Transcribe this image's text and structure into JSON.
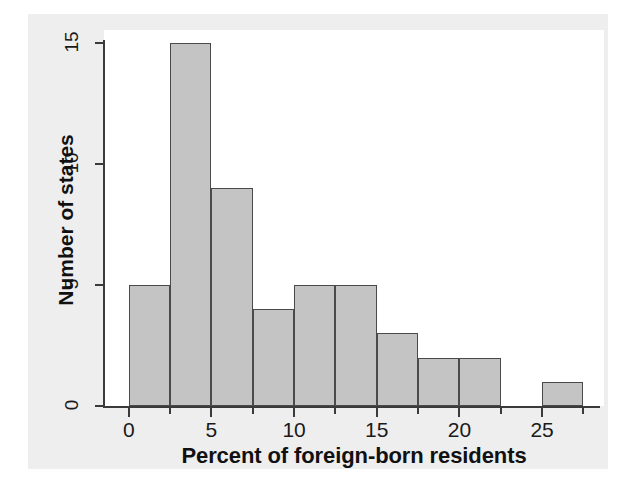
{
  "chart_data": {
    "type": "bar",
    "title": "",
    "subtitle": "",
    "xlabel": "Percent of foreign-born residents",
    "ylabel": "Number of states",
    "xlim": [
      -1.5,
      28.5
    ],
    "ylim": [
      0,
      15.4
    ],
    "bin_width": 2.5,
    "grid": false,
    "legend": null,
    "annotations": [],
    "bars": [
      {
        "bin_start": 0,
        "bin_end": 2.5,
        "value": 5
      },
      {
        "bin_start": 2.5,
        "bin_end": 5,
        "value": 15
      },
      {
        "bin_start": 5,
        "bin_end": 7.5,
        "value": 9
      },
      {
        "bin_start": 7.5,
        "bin_end": 10,
        "value": 4
      },
      {
        "bin_start": 10,
        "bin_end": 12.5,
        "value": 5
      },
      {
        "bin_start": 12.5,
        "bin_end": 15,
        "value": 5
      },
      {
        "bin_start": 15,
        "bin_end": 17.5,
        "value": 3
      },
      {
        "bin_start": 17.5,
        "bin_end": 20,
        "value": 2
      },
      {
        "bin_start": 20,
        "bin_end": 22.5,
        "value": 2
      },
      {
        "bin_start": 22.5,
        "bin_end": 25,
        "value": 0
      },
      {
        "bin_start": 25,
        "bin_end": 27.5,
        "value": 1
      }
    ],
    "categories": [
      "0-2.5",
      "2.5-5",
      "5-7.5",
      "7.5-10",
      "10-12.5",
      "12.5-15",
      "15-17.5",
      "17.5-20",
      "20-22.5",
      "22.5-25",
      "25-27.5"
    ],
    "values": [
      5,
      15,
      9,
      4,
      5,
      5,
      3,
      2,
      2,
      0,
      1
    ],
    "x_ticks": [
      {
        "value": 0,
        "label": "0",
        "major": true
      },
      {
        "value": 2.5,
        "label": "",
        "major": false
      },
      {
        "value": 5,
        "label": "5",
        "major": true
      },
      {
        "value": 7.5,
        "label": "",
        "major": false
      },
      {
        "value": 10,
        "label": "10",
        "major": true
      },
      {
        "value": 12.5,
        "label": "",
        "major": false
      },
      {
        "value": 15,
        "label": "15",
        "major": true
      },
      {
        "value": 17.5,
        "label": "",
        "major": false
      },
      {
        "value": 20,
        "label": "20",
        "major": true
      },
      {
        "value": 22.5,
        "label": "",
        "major": false
      },
      {
        "value": 25,
        "label": "25",
        "major": true
      },
      {
        "value": 27.5,
        "label": "",
        "major": false
      }
    ],
    "y_ticks": [
      {
        "value": 0,
        "label": "0"
      },
      {
        "value": 5,
        "label": "5"
      },
      {
        "value": 10,
        "label": "10"
      },
      {
        "value": 15,
        "label": "15"
      }
    ],
    "colors": {
      "bar_fill": "#c4c4c4",
      "bar_stroke": "#4a4a4a",
      "axis": "#3a3a3a",
      "plot_background": "#ffffff",
      "figure_background": "#eeeeee",
      "text": "#111111"
    }
  }
}
